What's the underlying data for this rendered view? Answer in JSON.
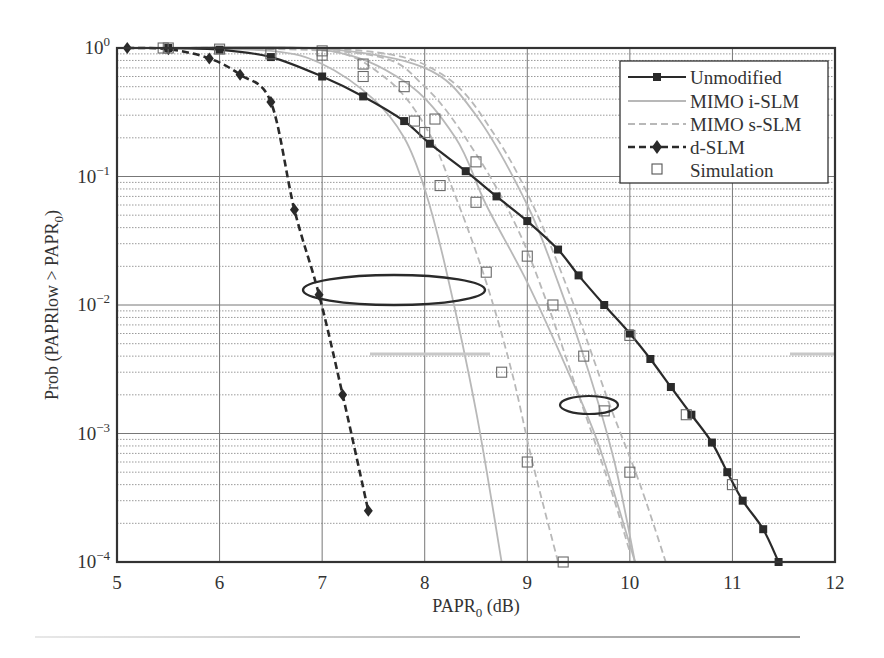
{
  "chart_data": {
    "type": "line",
    "title": "",
    "xlabel": "PAPR0 (dB)",
    "ylabel": "Prob (PAPRlow > PAPR0)",
    "xlim": [
      5,
      12
    ],
    "ylim": [
      0.0001,
      1
    ],
    "yscale": "log",
    "grid": true,
    "legend_position": "upper right",
    "x_ticks": [
      "5",
      "6",
      "7",
      "8",
      "9",
      "10",
      "11",
      "12"
    ],
    "y_ticks": [
      "10^0",
      "10^-1",
      "10^-2",
      "10^-3",
      "10^-4"
    ],
    "series": [
      {
        "name": "Unmodified",
        "style": "solid black, filled square markers",
        "x": [
          5.5,
          6,
          6.5,
          7,
          7.4,
          7.8,
          8.05,
          8.4,
          8.7,
          9,
          9.3,
          9.5,
          9.75,
          10,
          10.2,
          10.4,
          10.6,
          10.8,
          10.95,
          11.1,
          11.3,
          11.45
        ],
        "y": [
          1,
          0.97,
          0.85,
          0.6,
          0.42,
          0.27,
          0.18,
          0.11,
          0.07,
          0.045,
          0.027,
          0.017,
          0.01,
          0.006,
          0.0038,
          0.0023,
          0.0014,
          0.00085,
          0.0005,
          0.0003,
          0.00018,
          0.0001
        ]
      },
      {
        "name": "MIMO i-SLM",
        "style": "solid light gray, no markers (three curves)",
        "curves": [
          {
            "x": [
              5.5,
              6.5,
              7,
              7.5,
              7.8,
              8,
              8.2,
              8.5,
              8.75
            ],
            "y": [
              1,
              0.95,
              0.75,
              0.4,
              0.2,
              0.08,
              0.02,
              0.0015,
              0.0001
            ]
          },
          {
            "x": [
              5.5,
              7,
              7.8,
              8.3,
              8.6,
              9,
              9.4,
              9.7,
              10.05
            ],
            "y": [
              1,
              0.97,
              0.55,
              0.2,
              0.06,
              0.015,
              0.003,
              0.0008,
              0.0001
            ]
          },
          {
            "x": [
              5.5,
              7,
              8,
              8.5,
              9,
              9.3,
              9.6,
              9.85,
              10.05
            ],
            "y": [
              1,
              0.99,
              0.7,
              0.3,
              0.06,
              0.015,
              0.003,
              0.0006,
              0.0001
            ]
          }
        ]
      },
      {
        "name": "MIMO s-SLM",
        "style": "dashed light gray, no markers (three curves)",
        "curves": [
          {
            "x": [
              5.5,
              7,
              7.6,
              8,
              8.3,
              8.6,
              8.85,
              9.05,
              9.3
            ],
            "y": [
              1,
              0.97,
              0.6,
              0.25,
              0.07,
              0.015,
              0.003,
              0.0006,
              0.0001
            ]
          },
          {
            "x": [
              5.5,
              7.4,
              8,
              8.5,
              8.9,
              9.2,
              9.5,
              9.8,
              10
            ],
            "y": [
              1,
              0.9,
              0.5,
              0.15,
              0.04,
              0.01,
              0.002,
              0.0004,
              0.00012
            ]
          },
          {
            "x": [
              5.5,
              7.4,
              8.2,
              8.7,
              9.1,
              9.5,
              9.8,
              10.1,
              10.35
            ],
            "y": [
              1,
              0.95,
              0.6,
              0.2,
              0.05,
              0.008,
              0.0017,
              0.0004,
              0.0001
            ]
          }
        ]
      },
      {
        "name": "d-SLM",
        "style": "dashed black, diamond markers",
        "x": [
          5.1,
          5.5,
          5.9,
          6.2,
          6.5,
          6.73,
          6.97,
          7.2,
          7.45
        ],
        "y": [
          1,
          0.98,
          0.83,
          0.62,
          0.38,
          0.055,
          0.012,
          0.002,
          0.00025
        ]
      },
      {
        "name": "Simulation",
        "style": "open square markers",
        "x": [
          5.5,
          6,
          6.5,
          7,
          7,
          7.4,
          7.4,
          7.8,
          7.9,
          8,
          8.1,
          8.15,
          8.5,
          8.5,
          8.6,
          8.75,
          9,
          9,
          9.25,
          9.35,
          9.55,
          9.75,
          10,
          10,
          10.55,
          11,
          5.45
        ],
        "y": [
          1,
          0.98,
          0.9,
          0.95,
          0.88,
          0.75,
          0.6,
          0.5,
          0.27,
          0.22,
          0.28,
          0.085,
          0.13,
          0.063,
          0.018,
          0.003,
          0.024,
          0.0006,
          0.01,
          0.0001,
          0.004,
          0.0015,
          0.0005,
          0.0058,
          0.0014,
          0.0004,
          1
        ]
      }
    ],
    "annotations": [
      {
        "type": "ellipse",
        "center": [
          7.7,
          0.012
        ],
        "label": "group i-SLM/s-SLM near 10^-2"
      },
      {
        "type": "ellipse",
        "center": [
          9.6,
          0.0016
        ],
        "label": "group near 10^-3"
      }
    ]
  },
  "axes": {
    "xlabel_main": "PAPR",
    "xlabel_sub": "0",
    "xlabel_tail": " (dB)",
    "ylabel_main": "Prob (PAPRlow > PAPR",
    "ylabel_sub": "0",
    "ylabel_tail": ")",
    "x_ticks": [
      "5",
      "6",
      "7",
      "8",
      "9",
      "10",
      "11",
      "12"
    ],
    "y_tick_base": "10",
    "y_tick_exps": [
      "0",
      "−1",
      "−2",
      "−3",
      "−4"
    ]
  },
  "legend": {
    "items": [
      {
        "label": "Unmodified"
      },
      {
        "label": "MIMO i-SLM"
      },
      {
        "label": "MIMO s-SLM"
      },
      {
        "label": "d-SLM"
      },
      {
        "label": "Simulation"
      }
    ]
  },
  "colors": {
    "black_series": "#2a2a2a",
    "gray_series": "#b8b8b8",
    "grid": "#9a9a9a",
    "axis": "#333333"
  }
}
